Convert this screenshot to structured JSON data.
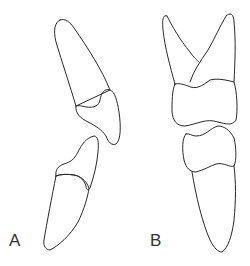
{
  "figure": {
    "panels": [
      {
        "label": "A",
        "description": "Two teeth in lateral view, upper tooth tilted with crown down-right, lower tooth with crown up"
      },
      {
        "label": "B",
        "description": "Two teeth in occlusion, upper two-rooted tooth above lower single-rooted tooth"
      }
    ]
  },
  "colors": {
    "stroke": "#2a2a2a",
    "background": "#ffffff"
  }
}
